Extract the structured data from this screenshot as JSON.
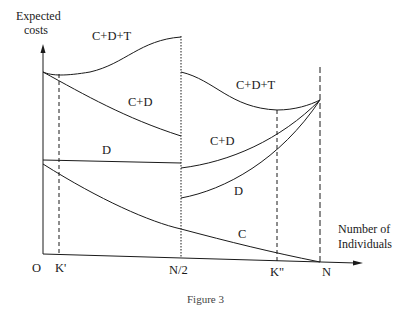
{
  "figure": {
    "caption": "Figure 3",
    "y_axis_title": [
      "Expected",
      "costs"
    ],
    "x_axis_title": [
      "Number of",
      "Individuals"
    ],
    "x_ticks": [
      "O",
      "K'",
      "N/2",
      "K\"",
      "N"
    ],
    "curve_labels": {
      "cdt_left": "C+D+T",
      "cd_left": "C+D",
      "d_left": "D",
      "cdt_right": "C+D+T",
      "cd_right": "C+D",
      "d_right": "D",
      "c": "C"
    },
    "colors": {
      "ink": "#1a1a1a",
      "background": "#ffffff"
    }
  }
}
